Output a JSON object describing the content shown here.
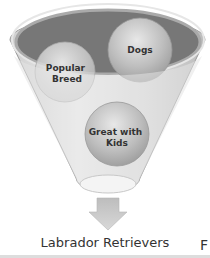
{
  "diagram": {
    "type": "funnel",
    "inputs": [
      {
        "label_line1": "Dogs",
        "label_line2": ""
      },
      {
        "label_line1": "Popular",
        "label_line2": "Breed"
      },
      {
        "label_line1": "Great with",
        "label_line2": "Kids"
      }
    ],
    "output": "Labrador Retrievers",
    "edge_fragment": "F",
    "colors": {
      "funnel_fill": "#d9d9d9",
      "funnel_inner": "#7a7a7a",
      "ball": "#bdbdbd",
      "arrow": "#c8c8c8",
      "text": "#333333"
    }
  }
}
